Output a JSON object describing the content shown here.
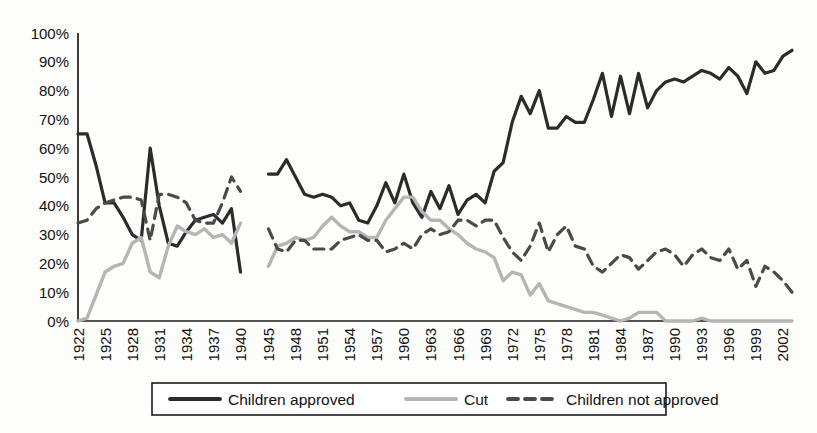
{
  "chart_data": {
    "type": "line",
    "title": "",
    "subtitle": "",
    "xlabel": "",
    "ylabel": "",
    "xlim": [
      1922,
      2003
    ],
    "ylim": [
      0,
      100
    ],
    "grid": false,
    "legend_position": "bottom",
    "y_ticks": [
      "0%",
      "10%",
      "20%",
      "30%",
      "40%",
      "50%",
      "60%",
      "70%",
      "80%",
      "90%",
      "100%"
    ],
    "y_tick_values": [
      0,
      10,
      20,
      30,
      40,
      50,
      60,
      70,
      80,
      90,
      100
    ],
    "x_ticks": [
      "1922",
      "1925",
      "1928",
      "1931",
      "1934",
      "1937",
      "1940",
      "1945",
      "1948",
      "1951",
      "1954",
      "1957",
      "1960",
      "1963",
      "1966",
      "1969",
      "1972",
      "1975",
      "1978",
      "1981",
      "1984",
      "1987",
      "1990",
      "1993",
      "1996",
      "1999",
      "2002"
    ],
    "x_tick_values": [
      1922,
      1925,
      1928,
      1931,
      1934,
      1937,
      1940,
      1945,
      1948,
      1951,
      1954,
      1957,
      1960,
      1963,
      1966,
      1969,
      1972,
      1975,
      1978,
      1981,
      1984,
      1987,
      1990,
      1993,
      1996,
      1999,
      2002
    ],
    "gap_years": [
      1941,
      1942,
      1943,
      1944
    ],
    "series": [
      {
        "name": "Children approved",
        "color": "#2b2b2b",
        "style": "solid",
        "width": 3.2,
        "segments": [
          {
            "x": [
              1922,
              1923,
              1924,
              1925,
              1926,
              1927,
              1928,
              1929,
              1930,
              1931,
              1932,
              1933,
              1934,
              1935,
              1936,
              1937,
              1938,
              1939,
              1940
            ],
            "y": [
              65,
              65,
              54,
              41,
              41,
              36,
              30,
              28,
              60,
              40,
              27,
              26,
              31,
              35,
              36,
              37,
              34,
              39,
              17
            ]
          },
          {
            "x": [
              1945,
              1946,
              1947,
              1948,
              1949,
              1950,
              1951,
              1952,
              1953,
              1954,
              1955,
              1956,
              1957,
              1958,
              1959,
              1960,
              1961,
              1962,
              1963,
              1964,
              1965,
              1966,
              1967,
              1968,
              1969,
              1970,
              1971,
              1972,
              1973,
              1974,
              1975,
              1976,
              1977,
              1978,
              1979,
              1980,
              1981,
              1982,
              1983,
              1984,
              1985,
              1986,
              1987,
              1988,
              1989,
              1990,
              1991,
              1992,
              1993,
              1994,
              1995,
              1996,
              1997,
              1998,
              1999,
              2000,
              2001,
              2002,
              2003
            ],
            "y": [
              51,
              51,
              56,
              50,
              44,
              43,
              44,
              43,
              40,
              41,
              35,
              34,
              40,
              48,
              41,
              51,
              41,
              36,
              45,
              39,
              47,
              37,
              42,
              44,
              41,
              52,
              55,
              69,
              78,
              72,
              80,
              67,
              67,
              71,
              69,
              69,
              77,
              86,
              71,
              85,
              72,
              86,
              74,
              80,
              83,
              84,
              83,
              85,
              87,
              86,
              84,
              88,
              85,
              79,
              90,
              86,
              87,
              92,
              94
            ]
          }
        ]
      },
      {
        "name": "Cut",
        "color": "#b5b5b5",
        "style": "solid",
        "width": 3.4,
        "segments": [
          {
            "x": [
              1922,
              1923,
              1924,
              1925,
              1926,
              1927,
              1928,
              1929,
              1930,
              1931,
              1932,
              1933,
              1934,
              1935,
              1936,
              1937,
              1938,
              1939,
              1940
            ],
            "y": [
              0,
              1,
              9,
              17,
              19,
              20,
              27,
              29,
              17,
              15,
              26,
              33,
              31,
              30,
              32,
              29,
              30,
              27,
              34
            ]
          },
          {
            "x": [
              1945,
              1946,
              1947,
              1948,
              1949,
              1950,
              1951,
              1952,
              1953,
              1954,
              1955,
              1956,
              1957,
              1958,
              1959,
              1960,
              1961,
              1962,
              1963,
              1964,
              1965,
              1966,
              1967,
              1968,
              1969,
              1970,
              1971,
              1972,
              1973,
              1974,
              1975,
              1976,
              1977,
              1978,
              1979,
              1980,
              1981,
              1982,
              1983,
              1984,
              1985,
              1986,
              1987,
              1988,
              1989,
              1990,
              1991,
              1992,
              1993,
              1994,
              1995,
              1996,
              1997,
              1998,
              1999,
              2000,
              2001,
              2002,
              2003
            ],
            "y": [
              19,
              26,
              27,
              29,
              28,
              29,
              33,
              36,
              33,
              31,
              31,
              29,
              29,
              35,
              39,
              43,
              43,
              38,
              35,
              35,
              32,
              30,
              27,
              25,
              24,
              22,
              14,
              17,
              16,
              9,
              13,
              7,
              6,
              5,
              4,
              3,
              3,
              2,
              1,
              0,
              1,
              3,
              3,
              3,
              0,
              0,
              0,
              0,
              1,
              0,
              0,
              0,
              0,
              0,
              0,
              0,
              0,
              0,
              0
            ]
          }
        ]
      },
      {
        "name": "Children not approved",
        "color": "#4a4a4a",
        "style": "dashed",
        "width": 3.2,
        "dash": "10,7",
        "segments": [
          {
            "x": [
              1922,
              1923,
              1924,
              1925,
              1926,
              1927,
              1928,
              1929,
              1930,
              1931,
              1932,
              1933,
              1934,
              1935,
              1936,
              1937,
              1938,
              1939,
              1940
            ],
            "y": [
              34,
              35,
              39,
              41,
              42,
              43,
              43,
              42,
              28,
              44,
              44,
              43,
              41,
              35,
              34,
              34,
              41,
              50,
              45
            ]
          },
          {
            "x": [
              1945,
              1946,
              1947,
              1948,
              1949,
              1950,
              1951,
              1952,
              1953,
              1954,
              1955,
              1956,
              1957,
              1958,
              1959,
              1960,
              1961,
              1962,
              1963,
              1964,
              1965,
              1966,
              1967,
              1968,
              1969,
              1970,
              1971,
              1972,
              1973,
              1974,
              1975,
              1976,
              1977,
              1978,
              1979,
              1980,
              1981,
              1982,
              1983,
              1984,
              1985,
              1986,
              1987,
              1988,
              1989,
              1990,
              1991,
              1992,
              1993,
              1994,
              1995,
              1996,
              1997,
              1998,
              1999,
              2000,
              2001,
              2002,
              2003
            ],
            "y": [
              32,
              25,
              24,
              28,
              28,
              25,
              25,
              25,
              28,
              29,
              30,
              28,
              28,
              24,
              25,
              27,
              25,
              30,
              32,
              30,
              31,
              35,
              35,
              33,
              35,
              35,
              29,
              24,
              21,
              26,
              34,
              24,
              30,
              33,
              26,
              25,
              19,
              17,
              20,
              23,
              22,
              18,
              21,
              24,
              25,
              23,
              19,
              23,
              25,
              22,
              21,
              25,
              18,
              21,
              12,
              19,
              17,
              14,
              10
            ]
          }
        ]
      }
    ]
  },
  "legend": {
    "items": [
      {
        "label": "Children approved"
      },
      {
        "label": "Cut"
      },
      {
        "label": "Children not approved"
      }
    ]
  }
}
